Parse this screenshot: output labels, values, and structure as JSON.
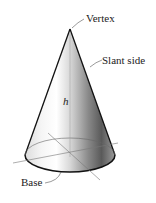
{
  "diagram": {
    "labels": {
      "vertex": "Vertex",
      "slant_side": "Slant side",
      "height": "h",
      "base": "Base"
    },
    "colors": {
      "outline": "#111111",
      "shade_dark": "#555555",
      "shade_light": "#ffffff",
      "axis_lines": "#777777"
    }
  }
}
